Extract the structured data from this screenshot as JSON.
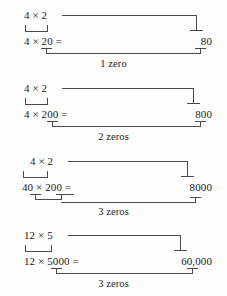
{
  "figure": {
    "ink_color": "#4a4a4a",
    "text_color": "#1b1b1b",
    "background_color": "#fdfdfb"
  },
  "blocks": [
    {
      "top_expression": "4 × 2",
      "bottom_expression": "4 × 20 =",
      "result": "80",
      "caption": "1 zero"
    },
    {
      "top_expression": "4 × 2",
      "bottom_expression": "4 × 200 =",
      "result": "800",
      "caption": "2 zeros"
    },
    {
      "top_expression": "4 × 2",
      "bottom_expression": "40 × 200 =",
      "result": "8000",
      "caption": "3 zeros"
    },
    {
      "top_expression": "12 × 5",
      "bottom_expression": "12 × 5000 =",
      "result": "60,000",
      "caption": "3 zeros"
    }
  ]
}
